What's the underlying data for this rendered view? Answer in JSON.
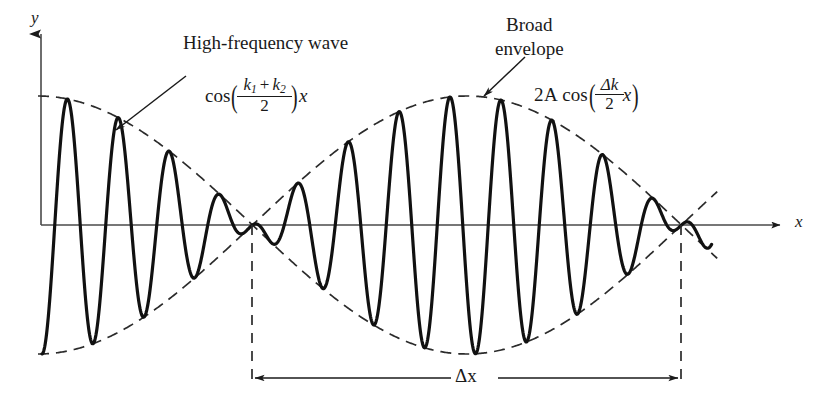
{
  "figure": {
    "kind": "wave-beat-diagram",
    "background_color": "#ffffff",
    "ink_color": "#1a1a1a"
  },
  "axes": {
    "y_label": "y",
    "x_label": "x",
    "origin": {
      "x": 41,
      "y": 225
    },
    "x_axis_end": {
      "x": 788,
      "y": 225
    },
    "y_axis_top": {
      "x": 41,
      "y": 28
    }
  },
  "annotations": {
    "high_frequency": {
      "label": "High-frequency wave",
      "formula_text": "cos((k1 + k2)/2)x",
      "formula_parts": {
        "cos": "cos",
        "open_paren": "(",
        "numerator_k1": "k",
        "numerator_k1_sub": "1",
        "plus": "+",
        "numerator_k2": "k",
        "numerator_k2_sub": "2",
        "denominator": "2",
        "close_paren": ")",
        "x": "x"
      }
    },
    "broad_envelope": {
      "label_line1": "Broad",
      "label_line2": "envelope",
      "formula_text": "2A cos((Δk/2)x)",
      "formula_parts": {
        "two_a": "2A",
        "cos": "cos",
        "open_paren": "(",
        "numerator": "Δk",
        "denominator": "2",
        "x": "x",
        "close_paren": ")"
      }
    },
    "delta_x": {
      "label": "Δx",
      "span_left_x": 252,
      "span_right_x": 681,
      "arrow_y": 378
    }
  },
  "chart_data": {
    "type": "line",
    "title": "",
    "xlabel": "x",
    "ylabel": "y",
    "grid": false,
    "legend": null,
    "series": [
      {
        "name": "High-frequency wave",
        "style": "solid",
        "description": "cos((k1+k2)x/2) modulated by envelope 2A cos(Δk x/2)",
        "carrier_wavelength_px": 51,
        "carrier_phase_offset_px": 42,
        "line_width": 3.1
      },
      {
        "name": "Broad envelope (upper)",
        "style": "dashed",
        "description": "2A cos(Δk x/2)",
        "line_width": 1.6
      },
      {
        "name": "Broad envelope (lower)",
        "style": "dashed",
        "description": "-2A cos(Δk x/2)",
        "line_width": 1.6
      }
    ],
    "envelope": {
      "amplitude_px": 129,
      "half_period_px": 429,
      "nodes_x": [
        252,
        681
      ],
      "antinodes_x": [
        38,
        466
      ],
      "baseline_y": 225
    },
    "xlim": [
      41,
      788
    ],
    "ylim": [
      -129,
      129
    ]
  }
}
